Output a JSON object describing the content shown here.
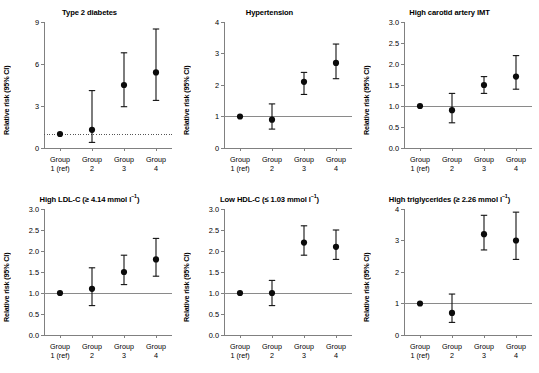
{
  "figure": {
    "categories": [
      "Group 1 (ref)",
      "Group 2",
      "Group 3",
      "Group 4"
    ],
    "category_lines": [
      [
        "Group",
        "1 (ref)"
      ],
      [
        "Group",
        "2"
      ],
      [
        "Group",
        "3"
      ],
      [
        "Group",
        "4"
      ]
    ],
    "ylabel": "Relative risk (95% CI)",
    "reference_value": 1.0
  },
  "chart_data": [
    {
      "type": "scatter",
      "panel_id": "type-2-diabetes",
      "title": "Type 2 diabetes",
      "title_main": "Type 2 diabetes",
      "title_sub": "",
      "xlabel": "",
      "ylabel": "Relative risk (95% CI)",
      "categories": [
        "Group 1 (ref)",
        "Group 2",
        "Group 3",
        "Group 4"
      ],
      "values": [
        1.0,
        1.3,
        4.5,
        5.4
      ],
      "ci_low": [
        1.0,
        0.4,
        2.95,
        3.4
      ],
      "ci_high": [
        1.0,
        4.1,
        6.8,
        8.5
      ],
      "ylim": [
        0,
        9
      ],
      "yticks": [
        0,
        3,
        6,
        9
      ],
      "ytick_labels": [
        "0",
        "3",
        "6",
        "9"
      ],
      "reference_line": 1.0,
      "reference_style": "dotted",
      "grid": false,
      "legend": "none"
    },
    {
      "type": "scatter",
      "panel_id": "hypertension",
      "title": "Hypertension",
      "title_main": "Hypertension",
      "title_sub": "",
      "xlabel": "",
      "ylabel": "Relative risk (95% CI)",
      "categories": [
        "Group 1 (ref)",
        "Group 2",
        "Group 3",
        "Group 4"
      ],
      "values": [
        1.0,
        0.9,
        2.1,
        2.7
      ],
      "ci_low": [
        1.0,
        0.6,
        1.7,
        2.2
      ],
      "ci_high": [
        1.0,
        1.4,
        2.4,
        3.3
      ],
      "ylim": [
        0,
        4
      ],
      "yticks": [
        0,
        1,
        2,
        3,
        4
      ],
      "ytick_labels": [
        "0",
        "1",
        "2",
        "3",
        "4"
      ],
      "reference_line": 1.0,
      "reference_style": "solid",
      "grid": false,
      "legend": "none"
    },
    {
      "type": "scatter",
      "panel_id": "high-carotid-artery-imt",
      "title": "High carotid artery IMT",
      "title_main": "High carotid artery IMT",
      "title_sub": "",
      "xlabel": "",
      "ylabel": "Relative risk (95% CI)",
      "categories": [
        "Group 1 (ref)",
        "Group 2",
        "Group 3",
        "Group 4"
      ],
      "values": [
        1.0,
        0.9,
        1.5,
        1.7
      ],
      "ci_low": [
        1.0,
        0.6,
        1.3,
        1.4
      ],
      "ci_high": [
        1.0,
        1.3,
        1.7,
        2.2
      ],
      "ylim": [
        0,
        3.0
      ],
      "yticks": [
        0,
        0.5,
        1.0,
        1.5,
        2.0,
        2.5,
        3.0
      ],
      "ytick_labels": [
        "0.0",
        "0.5",
        "1.0",
        "1.5",
        "2.0",
        "2.5",
        "3.0"
      ],
      "reference_line": 1.0,
      "reference_style": "solid",
      "grid": false,
      "legend": "none"
    },
    {
      "type": "scatter",
      "panel_id": "high-ldl-c",
      "title": "High LDL-C (≥ 4.14 mmol l-1)",
      "title_main": "High LDL-C (≥ 4.14 mmol l",
      "title_sub": "–1",
      "title_tail": ")",
      "xlabel": "",
      "ylabel": "Relative risk (95% CI)",
      "categories": [
        "Group 1 (ref)",
        "Group 2",
        "Group 3",
        "Group 4"
      ],
      "values": [
        1.0,
        1.1,
        1.5,
        1.8
      ],
      "ci_low": [
        1.0,
        0.7,
        1.2,
        1.4
      ],
      "ci_high": [
        1.0,
        1.6,
        1.9,
        2.3
      ],
      "ylim": [
        0,
        3.0
      ],
      "yticks": [
        0,
        0.5,
        1.0,
        1.5,
        2.0,
        2.5,
        3.0
      ],
      "ytick_labels": [
        "0.0",
        "0.5",
        "1.0",
        "1.5",
        "2.0",
        "2.5",
        "3.0"
      ],
      "reference_line": 1.0,
      "reference_style": "solid",
      "grid": false,
      "legend": "none"
    },
    {
      "type": "scatter",
      "panel_id": "low-hdl-c",
      "title": "Low HDL-C (≤ 1.03 mmol l-1)",
      "title_main": "Low HDL-C (≤ 1.03 mmol l",
      "title_sub": "–1",
      "title_tail": ")",
      "xlabel": "",
      "ylabel": "Relative risk (95% CI)",
      "categories": [
        "Group 1 (ref)",
        "Group 2",
        "Group 3",
        "Group 4"
      ],
      "values": [
        1.0,
        1.0,
        2.2,
        2.1
      ],
      "ci_low": [
        1.0,
        0.7,
        1.9,
        1.8
      ],
      "ci_high": [
        1.0,
        1.3,
        2.6,
        2.5
      ],
      "ylim": [
        0,
        3.0
      ],
      "yticks": [
        0,
        0.5,
        1.0,
        1.5,
        2.0,
        2.5,
        3.0
      ],
      "ytick_labels": [
        "0.0",
        "0.5",
        "1.0",
        "1.5",
        "2.0",
        "2.5",
        "3.0"
      ],
      "reference_line": 1.0,
      "reference_style": "solid",
      "grid": false,
      "legend": "none"
    },
    {
      "type": "scatter",
      "panel_id": "high-triglycerides",
      "title": "High triglycerides (≥ 2.26 mmol l-1)",
      "title_main": "High triglycerides (≥ 2.26 mmol l",
      "title_sub": "–1",
      "title_tail": ")",
      "xlabel": "",
      "ylabel": "Relative risk (95% CI)",
      "categories": [
        "Group 1 (ref)",
        "Group 2",
        "Group 3",
        "Group 4"
      ],
      "values": [
        1.0,
        0.7,
        3.2,
        3.0
      ],
      "ci_low": [
        1.0,
        0.4,
        2.7,
        2.4
      ],
      "ci_high": [
        1.0,
        1.3,
        3.8,
        3.9
      ],
      "ylim": [
        0,
        4
      ],
      "yticks": [
        0,
        1,
        2,
        3,
        4
      ],
      "ytick_labels": [
        "0",
        "1",
        "2",
        "3",
        "4"
      ],
      "reference_line": 1.0,
      "reference_style": "solid",
      "grid": false,
      "legend": "none"
    }
  ]
}
